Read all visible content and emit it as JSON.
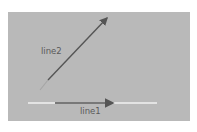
{
  "diagram": {
    "background_color": "#b9b9b9",
    "page_color": "#ffffff",
    "lines": [
      {
        "id": "line1",
        "label": "line1",
        "baseline": {
          "x1": 28,
          "y1": 103,
          "x2": 157,
          "y2": 103,
          "color": "#f2f2f2"
        },
        "arrow": {
          "x1": 55,
          "y1": 103,
          "x2": 115,
          "y2": 103,
          "color": "#555555",
          "head": "end"
        }
      },
      {
        "id": "line2",
        "label": "line2",
        "tail": {
          "x1": 40,
          "y1": 90,
          "x2": 48,
          "y2": 80,
          "color": "#a6a6a6"
        },
        "arrow": {
          "x1": 48,
          "y1": 80,
          "x2": 108,
          "y2": 17,
          "color": "#555555",
          "head": "end"
        }
      }
    ]
  }
}
